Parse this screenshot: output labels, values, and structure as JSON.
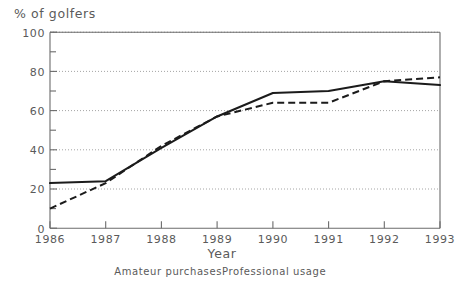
{
  "chart_data": {
    "type": "line",
    "title": "% of golfers",
    "xlabel": "Year",
    "ylabel": "",
    "categories": [
      "1986",
      "1987",
      "1988",
      "1989",
      "1990",
      "1991",
      "1992",
      "1993"
    ],
    "x": [
      1986,
      1987,
      1988,
      1989,
      1990,
      1991,
      1992,
      1993
    ],
    "series": [
      {
        "name": "Amateur purchases",
        "style": "solid",
        "values": [
          23,
          24,
          41,
          57,
          69,
          70,
          75,
          73
        ]
      },
      {
        "name": "Professional usage",
        "style": "dashed",
        "values": [
          10,
          23,
          42,
          57,
          64,
          64,
          75,
          77
        ]
      }
    ],
    "ylim": [
      0,
      100
    ],
    "xlim": [
      1986,
      1993
    ],
    "yticks": [
      0,
      20,
      40,
      60,
      80,
      100
    ],
    "ytick_labels": [
      "0",
      "20",
      "40",
      "60",
      "80",
      "100"
    ],
    "xtick_labels": [
      "1986",
      "1987",
      "1988",
      "1989",
      "1990",
      "1991",
      "1992",
      "1993"
    ],
    "grid": "horizontal-dotted",
    "gridlines_at": [
      20,
      40,
      60,
      80,
      100
    ],
    "legend_position": "below-axis-title",
    "minor_yticks": [
      10,
      30,
      50,
      70,
      90
    ],
    "line_color": "#1b1b1b",
    "axis_color": "#6b6b6b",
    "grid_color": "#9a9a9a",
    "background": "#ffffff"
  },
  "labels": {
    "title": "% of golfers",
    "xaxis_title": "Year",
    "legend_1": "Amateur purchases",
    "legend_2": "Professional usage",
    "y_0": "0",
    "y_20": "20",
    "y_40": "40",
    "y_60": "60",
    "y_80": "80",
    "y_100": "100",
    "x_1986": "1986",
    "x_1987": "1987",
    "x_1988": "1988",
    "x_1989": "1989",
    "x_1990": "1990",
    "x_1991": "1991",
    "x_1992": "1992",
    "x_1993": "1993"
  }
}
